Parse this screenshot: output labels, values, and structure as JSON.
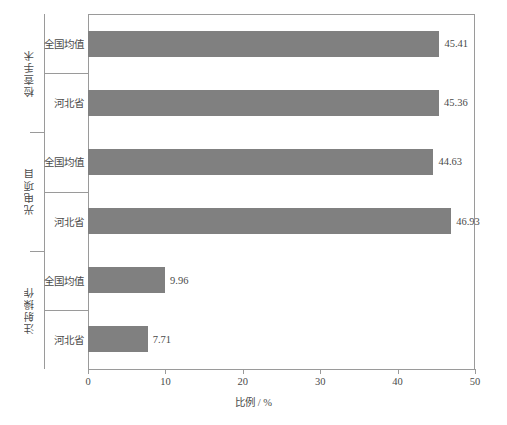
{
  "chart_data": {
    "type": "bar",
    "orientation": "horizontal",
    "title": "",
    "xlabel": "比例 / %",
    "ylabel": "",
    "xlim": [
      0,
      50
    ],
    "xticks": [
      0,
      10,
      20,
      30,
      40,
      50
    ],
    "xtick_labels": [
      "0",
      "10",
      "20",
      "30",
      "40",
      "50"
    ],
    "grid": false,
    "legend": false,
    "bar_color": "#808080",
    "axis_color": "#9a9a9a",
    "groups": [
      {
        "label": "检查手术",
        "categories": [
          "全国均值",
          "河北省"
        ],
        "values": [
          45.41,
          45.36
        ],
        "value_labels": [
          "45.41",
          "45.36"
        ]
      },
      {
        "label": "光电项目",
        "categories": [
          "全国均值",
          "河北省"
        ],
        "values": [
          44.63,
          46.93
        ],
        "value_labels": [
          "44.63",
          "46.93"
        ]
      },
      {
        "label": "注射操作",
        "categories": [
          "全国均值",
          "河北省"
        ],
        "values": [
          9.96,
          7.71
        ],
        "value_labels": [
          "9.96",
          "7.71"
        ]
      }
    ]
  }
}
